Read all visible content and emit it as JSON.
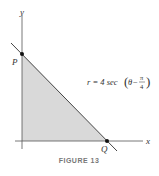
{
  "figure": {
    "caption": "FIGURE 13",
    "axes": {
      "x_label": "x",
      "y_label": "y"
    },
    "points": {
      "p_label": "P",
      "q_label": "Q"
    },
    "equation": {
      "lhs": "r = 4 sec",
      "theta": "θ",
      "minus": "−",
      "pi": "π",
      "four": "4"
    },
    "colors": {
      "fill": "#d9d9d9",
      "axis": "#555555",
      "line": "#444444"
    }
  }
}
